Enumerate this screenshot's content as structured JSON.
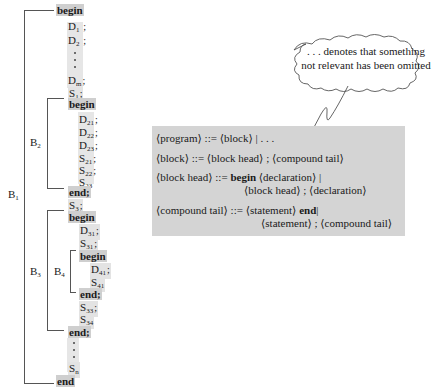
{
  "program_tree": {
    "outer_block": {
      "label": "B",
      "label_sub": "1",
      "begin": "begin",
      "declarations": [
        {
          "name": "D",
          "sub": "1",
          "term": ";"
        },
        {
          "name": "D",
          "sub": "2",
          "term": ";"
        },
        {
          "name": "D",
          "sub": "m",
          "term": ";"
        }
      ],
      "statement_1": {
        "name": "S",
        "sub": "1",
        "term": ";"
      },
      "statement_3": {
        "name": "S",
        "sub": "3",
        "term": ";"
      },
      "statement_n": {
        "name": "S",
        "sub": "n"
      },
      "end": "end"
    },
    "block_2": {
      "label": "B",
      "label_sub": "2",
      "begin": "begin",
      "declarations": [
        {
          "name": "D",
          "sub": "21",
          "term": ";"
        },
        {
          "name": "D",
          "sub": "22",
          "term": ";"
        },
        {
          "name": "D",
          "sub": "23",
          "term": ";"
        }
      ],
      "statements": [
        {
          "name": "S",
          "sub": "21",
          "term": ";"
        },
        {
          "name": "S",
          "sub": "22",
          "term": ";"
        },
        {
          "name": "S",
          "sub": "23",
          "term": ""
        }
      ],
      "end": "end;"
    },
    "block_3": {
      "label": "B",
      "label_sub": "3",
      "begin": "begin",
      "declarations": [
        {
          "name": "D",
          "sub": "31",
          "term": ";"
        }
      ],
      "statements_before": [
        {
          "name": "S",
          "sub": "31",
          "term": ";"
        }
      ],
      "statements_after": [
        {
          "name": "S",
          "sub": "33",
          "term": ";"
        },
        {
          "name": "S",
          "sub": "34",
          "term": ""
        }
      ],
      "end": "end;"
    },
    "block_4": {
      "label": "B",
      "label_sub": "4",
      "begin": "begin",
      "declarations": [
        {
          "name": "D",
          "sub": "41",
          "term": ";"
        }
      ],
      "statements": [
        {
          "name": "S",
          "sub": "41",
          "term": ""
        }
      ],
      "end": "end;"
    }
  },
  "callout": {
    "line1": ". . . denotes that something",
    "line2": "not relevant has been omitted"
  },
  "grammar": {
    "rules": [
      {
        "lhs": "⟨program⟩",
        "op": "::=",
        "rhs": [
          "⟨block⟩ | . . ."
        ]
      },
      {
        "lhs": "⟨block⟩",
        "op": "::=",
        "rhs": [
          "⟨block head⟩ ; ⟨compound tail⟩"
        ]
      },
      {
        "lhs": "⟨block head⟩",
        "op": "::=",
        "rhs_kw": "begin",
        "rhs": [
          "⟨declaration⟩ |",
          "⟨block head⟩ ; ⟨declaration⟩"
        ]
      },
      {
        "lhs": "⟨compound tail⟩",
        "op": "::=",
        "rhs_pre": "⟨statement⟩",
        "rhs_kw": "end",
        "rhs": [
          "|",
          "⟨statement⟩ ; ⟨compound tail⟩"
        ]
      }
    ]
  },
  "colors": {
    "grammar_bg": "#d4d4d4",
    "keyword_bg": "#cfcfcf",
    "highlight_bg": "#e3e3e3",
    "line": "#555555"
  }
}
